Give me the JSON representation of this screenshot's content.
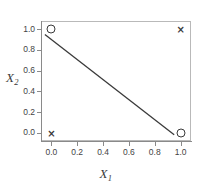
{
  "chart_data": {
    "type": "scatter",
    "title": "",
    "xlabel": "X_1",
    "ylabel": "X_2",
    "xlim": [
      -0.08,
      1.08
    ],
    "ylim": [
      -0.08,
      1.08
    ],
    "grid": false,
    "legend": "none",
    "xticks": [
      "0.0",
      "0.2",
      "0.4",
      "0.6",
      "0.8",
      "1.0"
    ],
    "xtick_values": [
      0.0,
      0.2,
      0.4,
      0.6,
      0.8,
      1.0
    ],
    "yticks": [
      "0.0",
      "0.2",
      "0.4",
      "0.6",
      "0.8",
      "1.0"
    ],
    "ytick_values": [
      0.0,
      0.2,
      0.4,
      0.6,
      0.8,
      1.0
    ],
    "series": [
      {
        "name": "class-circle",
        "marker": "circle-open",
        "points": [
          {
            "x": 0.0,
            "y": 1.0
          },
          {
            "x": 1.0,
            "y": 0.0
          }
        ]
      },
      {
        "name": "class-cross",
        "marker": "cross",
        "points": [
          {
            "x": 0.0,
            "y": 0.0
          },
          {
            "x": 1.0,
            "y": 1.0
          }
        ]
      }
    ],
    "annotations": [
      {
        "type": "line",
        "name": "decision-boundary",
        "x0": -0.05,
        "y0": 0.95,
        "x1": 0.95,
        "y1": -0.02,
        "color": "#3a3a3a"
      }
    ],
    "colors": {
      "marker": "#3a3a3a",
      "line": "#3a3a3a",
      "axis": "#8a8a8a",
      "frame": "#b9b9b9",
      "text": "#444444",
      "background": "#ffffff"
    }
  },
  "axis_titles": {
    "x_base": "X",
    "x_sub": "1",
    "y_base": "X",
    "y_sub": "2"
  }
}
